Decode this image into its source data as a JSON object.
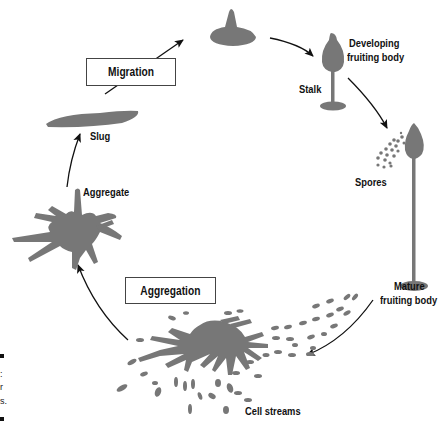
{
  "diagram": {
    "type": "life-cycle",
    "colors": {
      "shape": "#777777",
      "arrow": "#111111",
      "text": "#111111"
    },
    "stages": [
      {
        "id": "aggregation",
        "label": "Aggregation",
        "boxed": true
      },
      {
        "id": "cell_streams",
        "label": "Cell streams"
      },
      {
        "id": "aggregate",
        "label": "Aggregate"
      },
      {
        "id": "slug",
        "label": "Slug"
      },
      {
        "id": "migration",
        "label": "Migration",
        "boxed": true
      },
      {
        "id": "developing",
        "label": "Developing\nfruiting body",
        "line1": "Developing",
        "line2": "fruiting body"
      },
      {
        "id": "stalk",
        "label": "Stalk"
      },
      {
        "id": "spores",
        "label": "Spores"
      },
      {
        "id": "mature",
        "label": "Mature\nfruiting body",
        "line1": "Mature",
        "line2": "fruiting body"
      }
    ],
    "cropped_edge_text": [
      ":",
      "r",
      "s."
    ]
  }
}
